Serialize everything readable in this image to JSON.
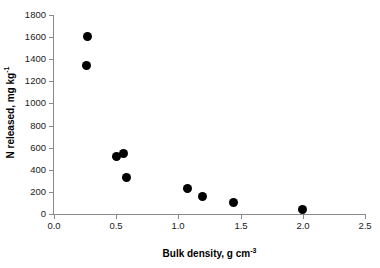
{
  "chart_data": {
    "type": "scatter",
    "title": "",
    "xlabel": "Bulk density, g cm⁻³",
    "xlabel_text": "Bulk density, g cm",
    "xlabel_sup": "-3",
    "ylabel": "N released, mg kg⁻¹",
    "ylabel_text": "N released, mg kg",
    "ylabel_sup": "-1",
    "xlim": [
      0.0,
      2.5
    ],
    "ylim": [
      0,
      1800
    ],
    "xticks": [
      0.0,
      0.5,
      1.0,
      1.5,
      2.0,
      2.5
    ],
    "xticklabels": [
      "0.0",
      "0.5",
      "1.0",
      "1.5",
      "2.0",
      "2.5"
    ],
    "yticks": [
      0,
      200,
      400,
      600,
      800,
      1000,
      1200,
      1400,
      1600,
      1800
    ],
    "yticklabels": [
      "0",
      "200",
      "400",
      "600",
      "800",
      "1000",
      "1200",
      "1400",
      "1600",
      "1800"
    ],
    "grid": false,
    "legend": false,
    "marker_color": "#000000",
    "axis_color": "#8a8a8a",
    "series": [
      {
        "name": "N released vs bulk density",
        "x": [
          0.27,
          0.26,
          0.5,
          0.56,
          0.58,
          1.07,
          1.19,
          1.44,
          2.0
        ],
        "y": [
          1610,
          1340,
          520,
          550,
          330,
          230,
          155,
          100,
          40
        ]
      }
    ]
  }
}
